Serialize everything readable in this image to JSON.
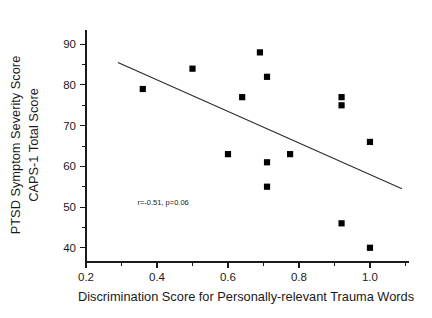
{
  "chart_data": {
    "type": "scatter",
    "title": "",
    "xlabel": "Discrimination Score for Personally-relevant Trauma Words",
    "ylabel_line1": "PTSD Symptom Severity Score",
    "ylabel_line2": "CAPS-1 Total Score",
    "xlim": [
      0.2,
      1.11
    ],
    "ylim": [
      36.5,
      93.5
    ],
    "xticks": [
      0.2,
      0.4,
      0.6,
      0.8,
      1.0
    ],
    "xticklabels": [
      "0.2",
      "0.4",
      "0.6",
      "0.8",
      "1.0"
    ],
    "xminorticks": [
      0.3,
      0.5,
      0.7,
      0.9,
      1.1
    ],
    "yticks": [
      40,
      50,
      60,
      70,
      80,
      90
    ],
    "yticklabels": [
      "40",
      "50",
      "60",
      "70",
      "80",
      "90"
    ],
    "yminorticks": [
      45,
      55,
      65,
      75,
      85
    ],
    "grid": false,
    "legend": "none",
    "marker": "filled-square",
    "marker_color": "#000000",
    "points": [
      {
        "x": 0.36,
        "y": 79
      },
      {
        "x": 0.5,
        "y": 84
      },
      {
        "x": 0.6,
        "y": 63
      },
      {
        "x": 0.64,
        "y": 77
      },
      {
        "x": 0.69,
        "y": 88
      },
      {
        "x": 0.71,
        "y": 82
      },
      {
        "x": 0.71,
        "y": 61
      },
      {
        "x": 0.71,
        "y": 55
      },
      {
        "x": 0.775,
        "y": 63
      },
      {
        "x": 0.92,
        "y": 77
      },
      {
        "x": 0.92,
        "y": 75
      },
      {
        "x": 0.92,
        "y": 46
      },
      {
        "x": 1.0,
        "y": 66
      },
      {
        "x": 1.0,
        "y": 40
      }
    ],
    "fit_line": {
      "x1": 0.29,
      "y1": 85.5,
      "x2": 1.09,
      "y2": 54.5
    },
    "annotation": {
      "text": "r=-0.51, p=0.06",
      "x": 0.345,
      "y": 50.4
    },
    "stats": {
      "r": -0.51,
      "p": 0.06
    }
  }
}
